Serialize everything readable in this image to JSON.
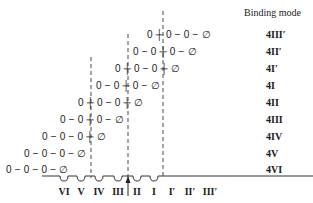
{
  "header": {
    "title": "Binding mode"
  },
  "rows": [
    {
      "mode": "4III′",
      "chain": "0 ┼ 0 − 0 − ∅",
      "x": 147,
      "y": 29
    },
    {
      "mode": "4II′",
      "chain": "0 − 0 ┼ 0 − ∅",
      "x": 133,
      "y": 46
    },
    {
      "mode": "4I′",
      "chain": "0 ┼ 0 − 0 ┼ ∅",
      "x": 115,
      "y": 63
    },
    {
      "mode": "4I",
      "chain": "0 − 0 ┼ 0 − ∅",
      "x": 96,
      "y": 80
    },
    {
      "mode": "4II",
      "chain": "0 ┼ 0 − 0 ┼ ∅",
      "x": 78,
      "y": 97
    },
    {
      "mode": "4III",
      "chain": "0 − 0 ┼ 0 − ∅",
      "x": 60,
      "y": 114
    },
    {
      "mode": "4IV",
      "chain": "0 − 0 − 0 ┼ ∅",
      "x": 42,
      "y": 131
    },
    {
      "mode": "4V",
      "chain": "0 − 0 − 0 − ∅",
      "x": 24,
      "y": 148
    },
    {
      "mode": "4VI",
      "chain": "0 − 0 − 0 − ∅",
      "x": 6,
      "y": 164
    }
  ],
  "sites": [
    {
      "label": "VI",
      "x": 64
    },
    {
      "label": "V",
      "x": 81
    },
    {
      "label": "IV",
      "x": 99
    },
    {
      "label": "III",
      "x": 118
    },
    {
      "label": "II",
      "x": 137
    },
    {
      "label": "I",
      "x": 154
    },
    {
      "label": "I′",
      "x": 172
    },
    {
      "label": "II′",
      "x": 190
    },
    {
      "label": "III′",
      "x": 210
    }
  ]
}
